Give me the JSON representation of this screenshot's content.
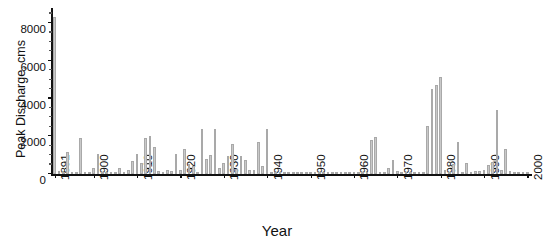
{
  "chart_data": {
    "type": "bar",
    "title": "",
    "xlabel": "Year",
    "ylabel": "Peak Discharge, cms",
    "xlim": [
      1890.4,
      2000.6
    ],
    "ylim": [
      0,
      8800
    ],
    "ytick_values": [
      0,
      2000,
      4000,
      6000,
      8000
    ],
    "ytick_labels": [
      "0",
      "2000",
      "4000",
      "6000",
      "8000"
    ],
    "yminor_step": 500,
    "xtick_values": [
      1891,
      1900,
      1910,
      1920,
      1930,
      1940,
      1950,
      1960,
      1970,
      1980,
      1990,
      2000
    ],
    "xtick_labels": [
      "1891",
      "1900",
      "1910",
      "1920",
      "1930",
      "1940",
      "1950",
      "1960",
      "1970",
      "1980",
      "1990",
      "2000"
    ],
    "grid": false,
    "legend": null,
    "bar_color": "#c9c9c9",
    "bar_edge_color": "#a9a9a9",
    "axis_color": "#111111",
    "background_color": "#ffffff",
    "series_name": "Annual peak discharge",
    "x": [
      1891,
      1892,
      1893,
      1894,
      1895,
      1896,
      1897,
      1898,
      1899,
      1900,
      1901,
      1902,
      1903,
      1904,
      1905,
      1906,
      1907,
      1908,
      1909,
      1910,
      1911,
      1912,
      1913,
      1914,
      1915,
      1916,
      1917,
      1918,
      1919,
      1920,
      1921,
      1922,
      1923,
      1924,
      1925,
      1926,
      1927,
      1928,
      1929,
      1930,
      1931,
      1932,
      1933,
      1934,
      1935,
      1936,
      1937,
      1938,
      1939,
      1940,
      1941,
      1942,
      1943,
      1944,
      1945,
      1946,
      1947,
      1948,
      1949,
      1950,
      1951,
      1952,
      1953,
      1954,
      1955,
      1956,
      1957,
      1958,
      1959,
      1960,
      1961,
      1962,
      1963,
      1964,
      1965,
      1966,
      1967,
      1968,
      1969,
      1970,
      1971,
      1972,
      1973,
      1974,
      1975,
      1976,
      1977,
      1978,
      1979,
      1980,
      1981,
      1982,
      1983,
      1984,
      1985,
      1986,
      1987,
      1988,
      1989,
      1990,
      1991,
      1992,
      1993,
      1994,
      1995,
      1996,
      1997,
      1998,
      1999,
      2000
    ],
    "values": [
      8300,
      150,
      60,
      1150,
      120,
      80,
      1900,
      70,
      120,
      330,
      1080,
      100,
      90,
      60,
      50,
      300,
      120,
      220,
      700,
      1050,
      560,
      1900,
      2000,
      1450,
      140,
      80,
      190,
      180,
      1080,
      230,
      1350,
      520,
      430,
      120,
      2400,
      820,
      1030,
      2400,
      300,
      600,
      950,
      1600,
      260,
      940,
      760,
      200,
      230,
      1700,
      410,
      2400,
      70,
      120,
      60,
      80,
      40,
      50,
      30,
      40,
      30,
      25,
      20,
      25,
      18,
      20,
      22,
      15,
      18,
      20,
      16,
      14,
      12,
      20,
      18,
      1820,
      1950,
      120,
      60,
      300,
      760,
      150,
      100,
      90,
      60,
      40,
      60,
      80,
      2550,
      4500,
      4700,
      5150,
      200,
      80,
      520,
      1700,
      130,
      600,
      110,
      160,
      140,
      200,
      480,
      650,
      3400,
      210,
      1350,
      180,
      130,
      90,
      60,
      40
    ]
  }
}
